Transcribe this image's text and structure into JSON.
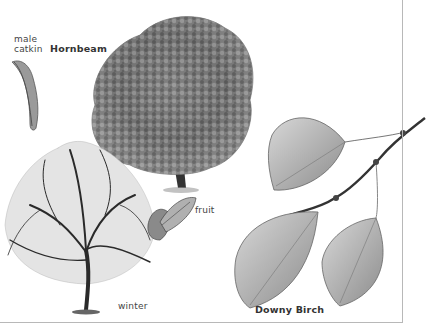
{
  "figure": {
    "labels": {
      "male_catkin_line1": "male",
      "male_catkin_line2": "catkin",
      "hornbeam": "Hornbeam",
      "fruit": "fruit",
      "winter": "winter",
      "downy_birch": "Downy Birch"
    },
    "colors": {
      "background": "#ffffff",
      "frame": "#b8b8b8",
      "text": "#444444"
    }
  }
}
